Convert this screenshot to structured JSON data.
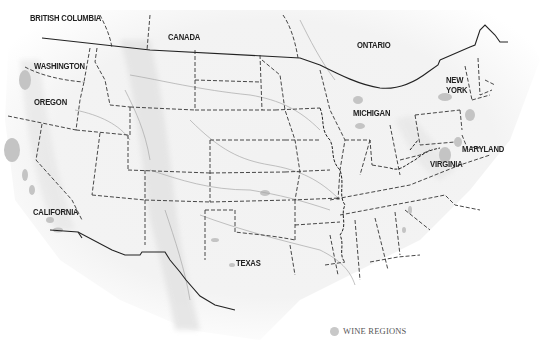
{
  "map": {
    "title": "",
    "labels": [
      {
        "id": "british-columbia",
        "text": "BRITISH COLUMBIA",
        "x": 30,
        "y": 19
      },
      {
        "id": "canada",
        "text": "CANADA",
        "x": 168,
        "y": 32
      },
      {
        "id": "ontario",
        "text": "ONTARIO",
        "x": 357,
        "y": 40
      },
      {
        "id": "washington",
        "text": "WASHINGTON",
        "x": 35,
        "y": 61
      },
      {
        "id": "oregon",
        "text": "OREGON",
        "x": 34,
        "y": 98
      },
      {
        "id": "new-york",
        "text": "NEW",
        "x": 446,
        "y": 76
      },
      {
        "id": "new-york-2",
        "text": "YORK",
        "x": 446,
        "y": 86
      },
      {
        "id": "michigan",
        "text": "MICHIGAN",
        "x": 353,
        "y": 108
      },
      {
        "id": "maryland",
        "text": "MARYLAND",
        "x": 462,
        "y": 145
      },
      {
        "id": "virginia",
        "text": "VIRGINIA",
        "x": 430,
        "y": 160
      },
      {
        "id": "california",
        "text": "CALIFORNIA",
        "x": 32,
        "y": 207
      },
      {
        "id": "texas",
        "text": "TEXAS",
        "x": 236,
        "y": 260
      }
    ],
    "legend": {
      "swatch_color": "#c8c8c8",
      "label": "WINE REGIONS"
    },
    "colors": {
      "border": "#222222",
      "river": "#a8a8a8",
      "terrain": "#e6e6e6",
      "wine_region": "#c4c4c4"
    }
  }
}
